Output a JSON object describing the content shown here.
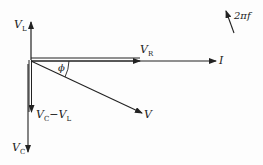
{
  "diagram": {
    "type": "phasor-diagram",
    "labels": {
      "vl": "V",
      "vl_sub": "L",
      "vr": "V",
      "vr_sub": "R",
      "i": "I",
      "phi": "ϕ",
      "v": "V",
      "vc_minus_vl_a": "V",
      "vc_minus_vl_a_sub": "C",
      "vc_minus_vl_op": "−V",
      "vc_minus_vl_b_sub": "L",
      "vc": "V",
      "vc_sub": "C",
      "rotation": "2πf"
    },
    "colors": {
      "stroke": "#222222",
      "background": "#fdfdfd"
    }
  }
}
